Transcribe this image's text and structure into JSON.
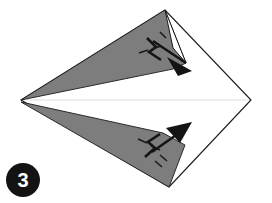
{
  "figure": {
    "step_number": "3",
    "background_color": "#ffffff",
    "shading_color": "#7d7d7d",
    "outline_color": "#1a1a1a",
    "center_line_color": "#e8e8e8",
    "badge_color": "#131313",
    "badge_text_color": "#ffffff"
  },
  "base_shape": {
    "name": "kite-outline",
    "description": "Four sided kite shaped paper outline",
    "vertices": [
      {
        "label": "left-point",
        "x": 21,
        "y": 100
      },
      {
        "label": "top-point",
        "x": 165,
        "y": 10
      },
      {
        "label": "right-point",
        "x": 251,
        "y": 100
      },
      {
        "label": "bottom-point",
        "x": 169,
        "y": 187
      }
    ]
  },
  "center_line": {
    "name": "horizontal-crease",
    "from": {
      "x": 23,
      "y": 100
    },
    "to": {
      "x": 250,
      "y": 100
    }
  },
  "flaps": [
    {
      "name": "upper-gray-flap",
      "fill": "#7d7d7d",
      "points": "21,100 165,10 186,63 173,69"
    },
    {
      "name": "lower-gray-flap",
      "fill": "#7d7d7d",
      "points": "21,102 169,187 185,145 163,133"
    }
  ],
  "fold_arrows": [
    {
      "name": "upper-fold-arrow",
      "direction": "down-right",
      "shaft": "152,40 190,66",
      "head": "191,67 171,59 180,74",
      "zigzag": "147,38 156,47 150,52 160,59",
      "ticks": [
        "140,52 149,50",
        "152,48 160,46"
      ]
    },
    {
      "name": "lower-fold-arrow",
      "direction": "up-right",
      "shaft": "151,151 188,126",
      "head": "189,125 168,127 180,140",
      "zigzag": "146,155 155,147 149,141 159,134",
      "ticks": [
        "139,140 148,143",
        "151,145 160,148",
        "160,152 166,158"
      ]
    }
  ],
  "step_badge": {
    "name": "step-badge",
    "label": "3",
    "center": {
      "x": 23,
      "y": 180
    },
    "radius": 17
  }
}
